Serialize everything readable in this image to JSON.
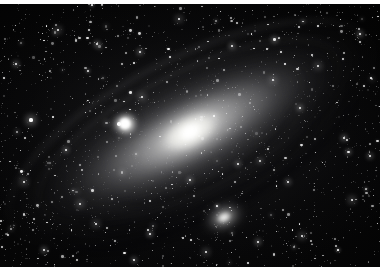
{
  "page": {
    "kind": "astronomical-photograph",
    "orientation": "landscape",
    "caption": "",
    "background_color": "#000000",
    "paper_color": "#ffffff"
  },
  "image": {
    "width": 392,
    "height": 273,
    "plate": {
      "x": 0,
      "y": 4,
      "width": 380,
      "height": 263
    },
    "palette": {
      "sky": "#030303",
      "faint_glow": "#282828",
      "disk": "#8c8c8f",
      "bulge": "#ececE9",
      "core": "#ffffff",
      "dust_lane": "#040406",
      "star": "#ffffff"
    }
  },
  "objects": [
    {
      "name": "M31 galaxy disk",
      "type": "spiral-galaxy",
      "center_x": 190,
      "center_y": 128,
      "major_axis": 430,
      "minor_axis": 160,
      "position_angle_deg": -27,
      "core_brightness": "saturated white"
    },
    {
      "name": "M32 companion",
      "type": "elliptical-galaxy",
      "center_x": 125,
      "center_y": 119,
      "size": 34
    },
    {
      "name": "M110 companion",
      "type": "elliptical-galaxy",
      "center_x": 224,
      "center_y": 213,
      "major_axis": 48,
      "minor_axis": 34,
      "position_angle_deg": -25
    }
  ],
  "features": {
    "dust_lanes": 3,
    "spiral_arms": 2,
    "star_count_rendered": 0
  },
  "borders": {
    "top_margin_px": 4,
    "bottom_margin_px": 6,
    "right_margin_px": 12,
    "left_margin_px": 0
  }
}
